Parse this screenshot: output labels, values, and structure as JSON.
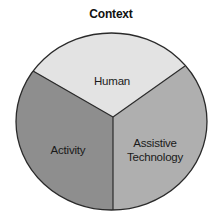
{
  "title": "Context",
  "segments": [
    {
      "id": "human",
      "label": "Human",
      "color": "#e3e3e3"
    },
    {
      "id": "activity",
      "label": "Activity",
      "color": "#8e8e8e"
    },
    {
      "id": "assistive-technology",
      "label_line1": "Assistive",
      "label_line2": "Technology",
      "color": "#afafaf"
    }
  ],
  "colors": {
    "outline": "#2a2a2a",
    "background": "#ffffff"
  }
}
